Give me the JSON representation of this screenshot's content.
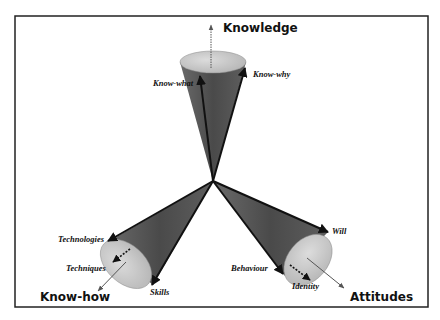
{
  "diagram": {
    "type": "three-cone knowledge model",
    "frame": {
      "border_color": "#222222",
      "background": "#ffffff"
    },
    "colors": {
      "cone_fill": "#5a5a5a",
      "cone_shade": "#3c3c3c",
      "ellipse_fill": "#c8c8c8",
      "arrow": "#111111",
      "thin_arrow": "#555555"
    },
    "cones": [
      {
        "id": "knowledge",
        "title": "Knowledge",
        "components": [
          "Know-what",
          "Know-why"
        ]
      },
      {
        "id": "know-how",
        "title": "Know-how",
        "components": [
          "Technologies",
          "Techniques",
          "Skills"
        ]
      },
      {
        "id": "attitudes",
        "title": "Attitudes",
        "components": [
          "Will",
          "Behaviour",
          "Identity"
        ]
      }
    ]
  }
}
